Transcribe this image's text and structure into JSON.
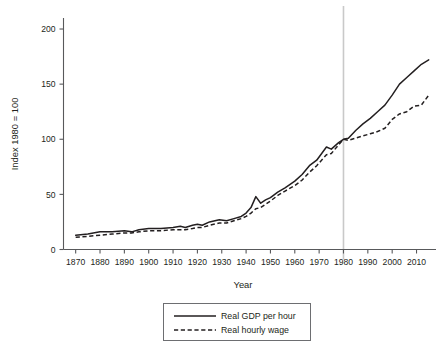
{
  "chart_data": {
    "type": "line",
    "title": "",
    "xlabel": "Year",
    "ylabel": "Index 1980 = 100",
    "xlim": [
      1865,
      2018
    ],
    "ylim": [
      0,
      210
    ],
    "xticks": [
      1870,
      1880,
      1890,
      1900,
      1910,
      1920,
      1930,
      1940,
      1950,
      1960,
      1970,
      1980,
      1990,
      2000,
      2010
    ],
    "yticks": [
      0,
      50,
      100,
      150,
      200
    ],
    "grid": false,
    "legend_position": "below-plot",
    "annotations": [
      {
        "type": "vline",
        "x": 1980,
        "color": "#c9c9c9",
        "label": ""
      }
    ],
    "series": [
      {
        "name": "Real GDP per hour",
        "style": "solid",
        "color": "#231f20",
        "x": [
          1870,
          1875,
          1880,
          1885,
          1890,
          1893,
          1896,
          1900,
          1905,
          1910,
          1913,
          1915,
          1918,
          1920,
          1922,
          1925,
          1929,
          1932,
          1935,
          1938,
          1940,
          1942,
          1944,
          1946,
          1948,
          1950,
          1953,
          1956,
          1960,
          1963,
          1966,
          1969,
          1973,
          1975,
          1978,
          1980,
          1982,
          1985,
          1988,
          1991,
          1994,
          1997,
          2000,
          2003,
          2006,
          2009,
          2012,
          2015
        ],
        "values": [
          13,
          14,
          16,
          16,
          17,
          16,
          18,
          19,
          19,
          20,
          21,
          20,
          22,
          23,
          22,
          25,
          27,
          26,
          28,
          30,
          33,
          38,
          48,
          42,
          45,
          47,
          52,
          56,
          62,
          68,
          76,
          81,
          93,
          91,
          97,
          100,
          101,
          108,
          114,
          119,
          125,
          131,
          140,
          150,
          156,
          162,
          168,
          172
        ]
      },
      {
        "name": "Real hourly wage",
        "style": "dashed",
        "color": "#231f20",
        "x": [
          1870,
          1875,
          1880,
          1885,
          1890,
          1893,
          1896,
          1900,
          1905,
          1910,
          1913,
          1915,
          1918,
          1920,
          1922,
          1925,
          1929,
          1932,
          1935,
          1938,
          1940,
          1942,
          1944,
          1946,
          1948,
          1950,
          1953,
          1956,
          1960,
          1963,
          1966,
          1969,
          1973,
          1975,
          1978,
          1980,
          1982,
          1985,
          1988,
          1991,
          1994,
          1997,
          2000,
          2003,
          2006,
          2009,
          2012,
          2015
        ],
        "values": [
          11,
          12,
          13,
          14,
          15,
          15,
          16,
          17,
          17,
          18,
          18,
          18,
          19,
          20,
          20,
          22,
          24,
          24,
          26,
          28,
          30,
          33,
          37,
          38,
          41,
          44,
          49,
          53,
          58,
          63,
          70,
          76,
          86,
          87,
          95,
          100,
          99,
          101,
          103,
          105,
          107,
          110,
          118,
          123,
          125,
          130,
          131,
          140
        ]
      }
    ]
  },
  "legend": {
    "entries": [
      {
        "label": "Real GDP per hour",
        "style": "solid"
      },
      {
        "label": "Real hourly wage",
        "style": "dashed"
      }
    ]
  },
  "axes": {
    "x_title": "Year",
    "y_title": "Index 1980 = 100",
    "x_tick_labels": [
      "1870",
      "1880",
      "1890",
      "1900",
      "1910",
      "1920",
      "1930",
      "1940",
      "1950",
      "1960",
      "1970",
      "1980",
      "1990",
      "2000",
      "2010"
    ],
    "y_tick_labels": [
      "0",
      "50",
      "100",
      "150",
      "200"
    ]
  },
  "colors": {
    "ink": "#231f20",
    "axis": "#58595b",
    "reference_line": "#c9c9c9",
    "background": "#ffffff"
  }
}
